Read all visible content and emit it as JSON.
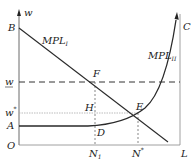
{
  "diagram": {
    "axes": {
      "y_label": "w",
      "origin": "O",
      "x_end": "L"
    },
    "points": {
      "B": "B",
      "C": "C",
      "A": "A",
      "F": "F",
      "H": "H",
      "E": "E",
      "D": "D"
    },
    "y_labels": {
      "w_bar": "w",
      "w_star": "w",
      "w_star_sup": "*"
    },
    "x_labels": {
      "N1": "N",
      "N1_sub": "1",
      "Nstar": "N",
      "Nstar_sup": "*"
    },
    "curves": {
      "mpl1_main": "MPL",
      "mpl1_sub": "I",
      "mpl2_main": "MPL",
      "mpl2_sub": "II"
    },
    "colors": {
      "line": "#2a2a2a",
      "dashed": "#333333",
      "light": "#9a9a9a"
    }
  }
}
